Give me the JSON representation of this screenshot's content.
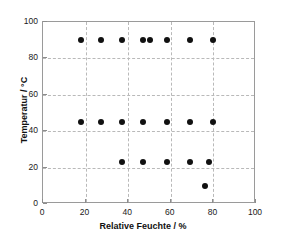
{
  "chart_data": {
    "type": "scatter",
    "title": "",
    "xlabel": "Relative Feuchte / %",
    "ylabel": "Temperatur / °C",
    "xlim": [
      0,
      100
    ],
    "ylim": [
      0,
      100
    ],
    "xticks": [
      0,
      20,
      40,
      60,
      80,
      100
    ],
    "yticks": [
      0,
      20,
      40,
      60,
      80,
      100
    ],
    "xticklabels": [
      "0",
      "20",
      "40",
      "60",
      "80",
      "100"
    ],
    "yticklabels": [
      "0",
      "20",
      "40",
      "60",
      "80",
      "100"
    ],
    "grid": true,
    "grid_style": "dashed",
    "legend": "none",
    "marker": "filled-circle",
    "marker_color": "#111111",
    "series": [
      {
        "name": "Messpunkte",
        "x": [
          18,
          27,
          37,
          47,
          50,
          58,
          69,
          80,
          18,
          27,
          37,
          47,
          58,
          69,
          80,
          37,
          47,
          58,
          69,
          78,
          76
        ],
        "y": [
          90,
          90,
          90,
          90,
          90,
          90,
          90,
          90,
          45,
          45,
          45,
          45,
          45,
          45,
          45,
          23,
          23,
          23,
          23,
          23,
          10
        ]
      }
    ],
    "points": [
      {
        "x": 18,
        "y": 90
      },
      {
        "x": 27,
        "y": 90
      },
      {
        "x": 37,
        "y": 90
      },
      {
        "x": 47,
        "y": 90
      },
      {
        "x": 50,
        "y": 90
      },
      {
        "x": 58,
        "y": 90
      },
      {
        "x": 69,
        "y": 90
      },
      {
        "x": 80,
        "y": 90
      },
      {
        "x": 18,
        "y": 45
      },
      {
        "x": 27,
        "y": 45
      },
      {
        "x": 37,
        "y": 45
      },
      {
        "x": 47,
        "y": 45
      },
      {
        "x": 58,
        "y": 45
      },
      {
        "x": 69,
        "y": 45
      },
      {
        "x": 80,
        "y": 45
      },
      {
        "x": 37,
        "y": 23
      },
      {
        "x": 47,
        "y": 23
      },
      {
        "x": 58,
        "y": 23
      },
      {
        "x": 69,
        "y": 23
      },
      {
        "x": 78,
        "y": 23
      },
      {
        "x": 76,
        "y": 10
      }
    ],
    "colors": {
      "marker": "#111111",
      "grid": "#b9b9b9",
      "frame": "#9a9a9a",
      "text": "#111111",
      "background": "#ffffff"
    }
  }
}
